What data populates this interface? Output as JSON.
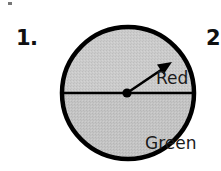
{
  "page": {
    "background_color": "#ffffff",
    "width": 221,
    "height": 171
  },
  "problem": {
    "number_label": "1.",
    "next_number_label": "2."
  },
  "spinner": {
    "name": "two-sector-probability-spinner",
    "outline_color": "#000000",
    "fill_color": "#c8c8c8",
    "divider_color": "#000000",
    "pointer_color": "#000000",
    "pivot_color": "#000000",
    "pointer_direction": "up-right",
    "sectors": [
      {
        "label": "Red",
        "position": "top",
        "fill_color": "#cccccc",
        "fraction": "1/2"
      },
      {
        "label": "Green",
        "position": "bottom",
        "fill_color": "#c4c4c4",
        "fraction": "1/2"
      }
    ]
  }
}
